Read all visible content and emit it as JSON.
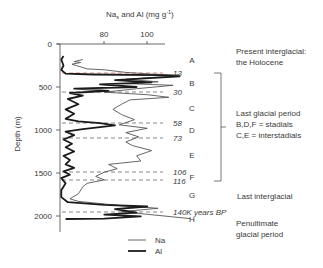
{
  "chart_data": {
    "type": "line",
    "title_parts": {
      "main": "Na",
      "sub": "s",
      "rest": " and Al  (mg g",
      "sup": "-1",
      "end": ")"
    },
    "xlabel": "Na_s and Al (mg g⁻¹)",
    "ylabel": "Depth (m)",
    "x_ticks": [
      80,
      100
    ],
    "y_ticks": [
      0,
      500,
      1000,
      1500,
      2000
    ],
    "xlim": [
      58,
      120
    ],
    "ylim": [
      0,
      2200
    ],
    "y_inverted": true,
    "legend": {
      "position": "bottom-center",
      "entries": [
        {
          "name": "Na",
          "style": "thin line"
        },
        {
          "name": "Al",
          "style": "thick line"
        }
      ]
    },
    "series": [
      {
        "name": "Na",
        "color": "#555555",
        "width": 0.9,
        "points": [
          [
            70,
            180
          ],
          [
            66,
            205
          ],
          [
            69,
            215
          ],
          [
            65,
            235
          ],
          [
            67,
            250
          ],
          [
            72,
            290
          ],
          [
            80,
            300
          ],
          [
            90,
            330
          ],
          [
            102,
            350
          ],
          [
            115,
            360
          ],
          [
            108,
            380
          ],
          [
            90,
            410
          ],
          [
            105,
            440
          ],
          [
            90,
            460
          ],
          [
            112,
            480
          ],
          [
            95,
            520
          ],
          [
            80,
            560
          ],
          [
            100,
            590
          ],
          [
            110,
            620
          ],
          [
            92,
            650
          ],
          [
            88,
            700
          ],
          [
            84,
            760
          ],
          [
            88,
            820
          ],
          [
            94,
            880
          ],
          [
            87,
            940
          ],
          [
            100,
            980
          ],
          [
            90,
            1030
          ],
          [
            96,
            1080
          ],
          [
            90,
            1140
          ],
          [
            93,
            1180
          ],
          [
            102,
            1240
          ],
          [
            95,
            1300
          ],
          [
            97,
            1360
          ],
          [
            82,
            1400
          ],
          [
            86,
            1450
          ],
          [
            80,
            1490
          ],
          [
            76,
            1540
          ],
          [
            80,
            1580
          ],
          [
            72,
            1620
          ],
          [
            70,
            1660
          ],
          [
            68,
            1740
          ],
          [
            64,
            1800
          ],
          [
            68,
            1830
          ],
          [
            88,
            1880
          ],
          [
            105,
            1910
          ],
          [
            88,
            1950
          ],
          [
            100,
            1980
          ],
          [
            112,
            2010
          ],
          [
            120,
            2030
          ]
        ]
      },
      {
        "name": "Al",
        "color": "#1a1a1a",
        "width": 1.8,
        "points": [
          [
            61,
            140
          ],
          [
            60,
            180
          ],
          [
            61,
            250
          ],
          [
            60,
            300
          ],
          [
            62,
            345
          ],
          [
            75,
            355
          ],
          [
            105,
            362
          ],
          [
            115,
            375
          ],
          [
            85,
            420
          ],
          [
            102,
            445
          ],
          [
            78,
            470
          ],
          [
            95,
            500
          ],
          [
            66,
            520
          ],
          [
            82,
            545
          ],
          [
            64,
            570
          ],
          [
            70,
            600
          ],
          [
            63,
            640
          ],
          [
            68,
            700
          ],
          [
            62,
            760
          ],
          [
            66,
            810
          ],
          [
            62,
            870
          ],
          [
            68,
            900
          ],
          [
            78,
            920
          ],
          [
            85,
            945
          ],
          [
            70,
            990
          ],
          [
            62,
            1020
          ],
          [
            66,
            1060
          ],
          [
            61,
            1110
          ],
          [
            65,
            1160
          ],
          [
            62,
            1200
          ],
          [
            66,
            1250
          ],
          [
            61,
            1300
          ],
          [
            64,
            1350
          ],
          [
            62,
            1400
          ],
          [
            66,
            1440
          ],
          [
            61,
            1480
          ],
          [
            64,
            1520
          ],
          [
            60,
            1560
          ],
          [
            62,
            1620
          ],
          [
            60,
            1700
          ],
          [
            60,
            1780
          ],
          [
            63,
            1840
          ],
          [
            80,
            1870
          ],
          [
            100,
            1890
          ],
          [
            85,
            1920
          ],
          [
            95,
            1960
          ],
          [
            80,
            1985
          ],
          [
            97,
            2005
          ],
          [
            80,
            2030
          ],
          [
            62,
            2035
          ]
        ]
      }
    ],
    "annotations": {
      "boundaries": [
        {
          "label": "13",
          "depth": 335,
          "color": "#d9534f",
          "style": "dashed"
        },
        {
          "label": "30",
          "depth": 560,
          "color": "#555555",
          "style": "dashed"
        },
        {
          "label": "58",
          "depth": 920,
          "color": "#555555",
          "style": "dashed"
        },
        {
          "label": "73",
          "depth": 1095,
          "color": "#555555",
          "style": "dashed"
        },
        {
          "label": "106",
          "depth": 1490,
          "color": "#555555",
          "style": "dashed"
        },
        {
          "label": "116",
          "depth": 1585,
          "color": "#555555",
          "style": "dashed"
        },
        {
          "label": "140K years BP",
          "depth": 1955,
          "color": "#555555",
          "style": "dashed"
        }
      ],
      "stages": [
        {
          "label": "A",
          "depth": 195
        },
        {
          "label": "B",
          "depth": 450
        },
        {
          "label": "C",
          "depth": 745
        },
        {
          "label": "D",
          "depth": 1010
        },
        {
          "label": "E",
          "depth": 1300
        },
        {
          "label": "F",
          "depth": 1545
        },
        {
          "label": "G",
          "depth": 1765
        },
        {
          "label": "H",
          "depth": 2080
        }
      ],
      "periods": [
        {
          "lines": [
            "Present interglacial:",
            "the Holocene"
          ]
        },
        {
          "lines": [
            "Last glacial period",
            "B,D,F = stadials",
            "C,E = interstadials"
          ]
        },
        {
          "lines": [
            "Last interglacial"
          ]
        },
        {
          "lines": [
            "Penultimate",
            "glacial period"
          ]
        }
      ]
    }
  },
  "axis": {
    "title_main": "Na",
    "title_sub": "s",
    "title_rest": " and Al  (mg g",
    "title_sup": "-1",
    "title_end": ")",
    "x_tick_80": "80",
    "x_tick_100": "100",
    "y_label": "Depth (m)",
    "y_tick_0": "0",
    "y_tick_500": "500",
    "y_tick_1000": "1000",
    "y_tick_1500": "1500",
    "y_tick_2000": "2000"
  },
  "boundaries": {
    "b13": "13",
    "b30": "30",
    "b58": "58",
    "b73": "73",
    "b106": "106",
    "b116": "116",
    "b140": "140K years BP"
  },
  "stages": {
    "A": "A",
    "B": "B",
    "C": "C",
    "D": "D",
    "E": "E",
    "F": "F",
    "G": "G",
    "H": "H"
  },
  "periods": {
    "holocene_1": "Present interglacial:",
    "holocene_2": "the Holocene",
    "glacial_1": "Last glacial period",
    "glacial_2": "B,D,F = stadials",
    "glacial_3": "C,E = interstadials",
    "interglacial": "Last interglacial",
    "penultimate_1": "Penultimate",
    "penultimate_2": "glacial period"
  },
  "legend": {
    "na": "Na",
    "al": "Al"
  }
}
